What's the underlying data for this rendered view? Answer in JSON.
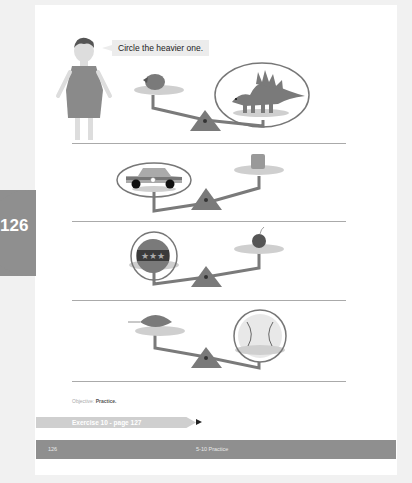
{
  "page_tab": {
    "number": "126"
  },
  "instruction": {
    "text": "Circle the heavier one."
  },
  "exercises": [
    {
      "left": "strawberry",
      "right": "stegosaurus",
      "circled": "right"
    },
    {
      "left": "toy-car",
      "right": "cube-block",
      "circled": "left"
    },
    {
      "left": "drum",
      "right": "cherry",
      "circled": "left"
    },
    {
      "left": "leaf",
      "right": "baseball",
      "circled": "right"
    }
  ],
  "objective": {
    "label": "Objective:",
    "value": "Practice."
  },
  "exercise_link": {
    "text": "Exercise 10 - page 127"
  },
  "footer": {
    "page_number": "126",
    "section": "5-10 Practice"
  },
  "colors": {
    "primary_gray": "#8f8f8f",
    "plate_gray": "#cccccc",
    "light_bg": "#f1f1f1"
  }
}
